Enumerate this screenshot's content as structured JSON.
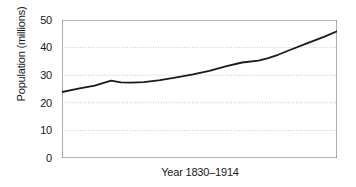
{
  "chart_data": {
    "type": "line",
    "title": "",
    "subtitle": "",
    "xlabel": "Year 1830–1914",
    "ylabel": "Population (millions)",
    "xlim": [
      1830,
      1914
    ],
    "ylim": [
      0,
      50
    ],
    "grid": true,
    "grid_axis": "y",
    "legend": false,
    "legend_position": "none",
    "y_ticks": [
      50,
      40,
      30,
      20,
      10,
      0
    ],
    "y_tick_labels": [
      "50",
      "40",
      "30",
      "20",
      "10",
      "0"
    ],
    "x_ticks": [],
    "x_tick_labels": [],
    "line_color": "#1a1a1a",
    "line_width": 1.8,
    "series": [
      {
        "name": "Population",
        "x": [
          1830,
          1835,
          1840,
          1845,
          1848,
          1851,
          1855,
          1860,
          1865,
          1870,
          1875,
          1880,
          1885,
          1890,
          1893,
          1896,
          1900,
          1905,
          1910,
          1914
        ],
        "values": [
          23.9,
          25.1,
          26.2,
          28.0,
          27.4,
          27.3,
          27.5,
          28.2,
          29.2,
          30.3,
          31.6,
          33.2,
          34.6,
          35.3,
          36.2,
          37.4,
          39.3,
          41.6,
          43.9,
          45.9
        ]
      }
    ]
  },
  "figure": {
    "axis_color": "#6a6a6a",
    "grid_color": "#b8b8b8",
    "background": "#ffffff"
  }
}
